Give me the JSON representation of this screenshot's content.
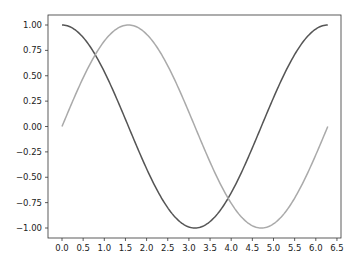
{
  "chart_data": {
    "type": "line",
    "title": "",
    "xlabel": "",
    "ylabel": "",
    "xlim": [
      -0.31,
      6.59
    ],
    "ylim": [
      -1.1,
      1.1
    ],
    "grid": false,
    "legend": null,
    "x_ticks": [
      "0.0",
      "0.5",
      "1.0",
      "1.5",
      "2.0",
      "2.5",
      "3.0",
      "3.5",
      "4.0",
      "4.5",
      "5.0",
      "5.5",
      "6.0",
      "6.5"
    ],
    "y_ticks": [
      "1.00",
      "0.75",
      "0.50",
      "0.25",
      "0.00",
      "−0.25",
      "−0.50",
      "−0.75",
      "−1.00"
    ],
    "series": [
      {
        "name": "cos(x)",
        "color": "#555555",
        "function": "cos",
        "x_range": [
          0,
          6.2832
        ],
        "x": [
          0,
          0.785,
          1.571,
          2.356,
          3.142,
          3.927,
          4.712,
          5.498,
          6.283
        ],
        "values": [
          1.0,
          0.707,
          0.0,
          -0.707,
          -1.0,
          -0.707,
          0.0,
          0.707,
          1.0
        ]
      },
      {
        "name": "sin(x)",
        "color": "#aaaaaa",
        "function": "sin",
        "x_range": [
          0,
          6.2832
        ],
        "x": [
          0,
          0.785,
          1.571,
          2.356,
          3.142,
          3.927,
          4.712,
          5.498,
          6.283
        ],
        "values": [
          0.0,
          0.707,
          1.0,
          0.707,
          0.0,
          -0.707,
          -1.0,
          -0.707,
          0.0
        ]
      }
    ]
  }
}
